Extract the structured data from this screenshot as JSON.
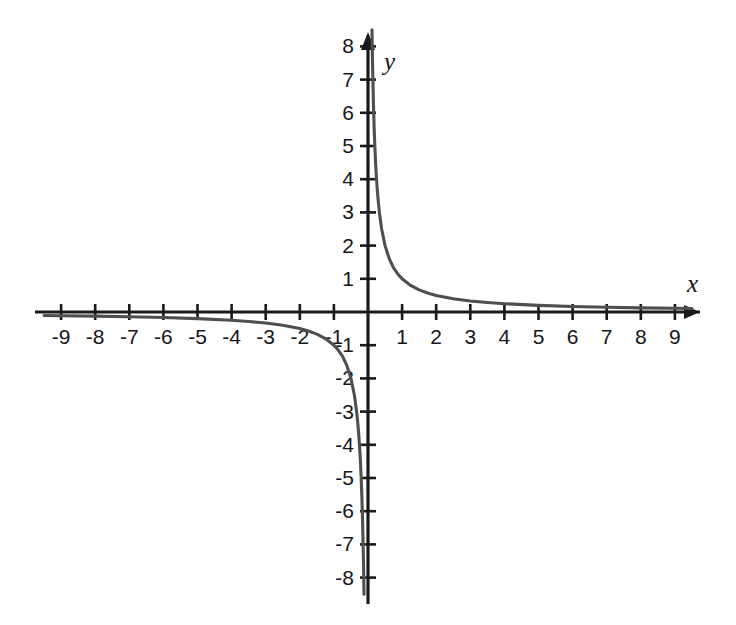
{
  "figure": {
    "title": "",
    "background_color": "#ffffff",
    "axis_color": "#1a1a1a",
    "curve_color": "#4f4f4f",
    "label_color": "#16161a"
  },
  "axes": {
    "x_axis_name": "x",
    "y_axis_name": "y",
    "x_tick_labels": [
      "-9",
      "-8",
      "-7",
      "-6",
      "-5",
      "-4",
      "-3",
      "-2",
      "-1",
      "1",
      "2",
      "3",
      "4",
      "5",
      "6",
      "7",
      "8",
      "9"
    ],
    "y_tick_labels": [
      "8",
      "7",
      "6",
      "5",
      "4",
      "3",
      "2",
      "1",
      "-1",
      "-2",
      "-3",
      "-4",
      "-5",
      "-6",
      "-7",
      "-8"
    ],
    "x_arrow_positive": true,
    "x_arrow_negative": false,
    "y_arrow_positive": true,
    "y_arrow_negative": false
  },
  "chart_data": {
    "type": "line",
    "title": "",
    "subtitle": "",
    "xlabel": "x",
    "ylabel": "y",
    "xlim": [
      -9.6,
      9.6
    ],
    "ylim": [
      -8.4,
      8.4
    ],
    "grid": false,
    "legend": null,
    "legend_position": "none",
    "x_ticks": [
      -9,
      -8,
      -7,
      -6,
      -5,
      -4,
      -3,
      -2,
      -1,
      1,
      2,
      3,
      4,
      5,
      6,
      7,
      8,
      9
    ],
    "y_ticks": [
      8,
      7,
      6,
      5,
      4,
      3,
      2,
      1,
      -1,
      -2,
      -3,
      -4,
      -5,
      -6,
      -7,
      -8
    ],
    "equation": "y = 1/x",
    "asymptotes": {
      "vertical": [
        0
      ],
      "horizontal": [
        0
      ]
    },
    "series": [
      {
        "name": "y = 1/x (right branch)",
        "x": [
          0.118,
          0.125,
          0.135,
          0.15,
          0.167,
          0.182,
          0.2,
          0.222,
          0.25,
          0.286,
          0.333,
          0.4,
          0.5,
          0.625,
          0.75,
          0.9,
          1.0,
          1.25,
          1.5,
          1.75,
          2.0,
          2.5,
          3.0,
          3.5,
          4.0,
          5.0,
          6.0,
          7.0,
          8.0,
          9.0,
          9.5
        ],
        "y": [
          8.5,
          8.0,
          7.41,
          6.67,
          5.99,
          5.49,
          5.0,
          4.5,
          4.0,
          3.5,
          3.0,
          2.5,
          2.0,
          1.6,
          1.33,
          1.11,
          1.0,
          0.8,
          0.667,
          0.571,
          0.5,
          0.4,
          0.333,
          0.286,
          0.25,
          0.2,
          0.167,
          0.143,
          0.125,
          0.111,
          0.105
        ]
      },
      {
        "name": "y = 1/x (left branch)",
        "x": [
          -9.5,
          -9.0,
          -8.0,
          -7.0,
          -6.0,
          -5.0,
          -4.0,
          -3.5,
          -3.0,
          -2.5,
          -2.0,
          -1.75,
          -1.5,
          -1.25,
          -1.0,
          -0.9,
          -0.75,
          -0.625,
          -0.5,
          -0.4,
          -0.333,
          -0.286,
          -0.25,
          -0.222,
          -0.2,
          -0.182,
          -0.167,
          -0.15,
          -0.135,
          -0.125,
          -0.118
        ],
        "y": [
          -0.105,
          -0.111,
          -0.125,
          -0.143,
          -0.167,
          -0.2,
          -0.25,
          -0.286,
          -0.333,
          -0.4,
          -0.5,
          -0.571,
          -0.667,
          -0.8,
          -1.0,
          -1.11,
          -1.33,
          -1.6,
          -2.0,
          -2.5,
          -3.0,
          -3.5,
          -4.0,
          -4.5,
          -5.0,
          -5.49,
          -5.99,
          -6.67,
          -7.41,
          -8.0,
          -8.5
        ]
      }
    ]
  }
}
